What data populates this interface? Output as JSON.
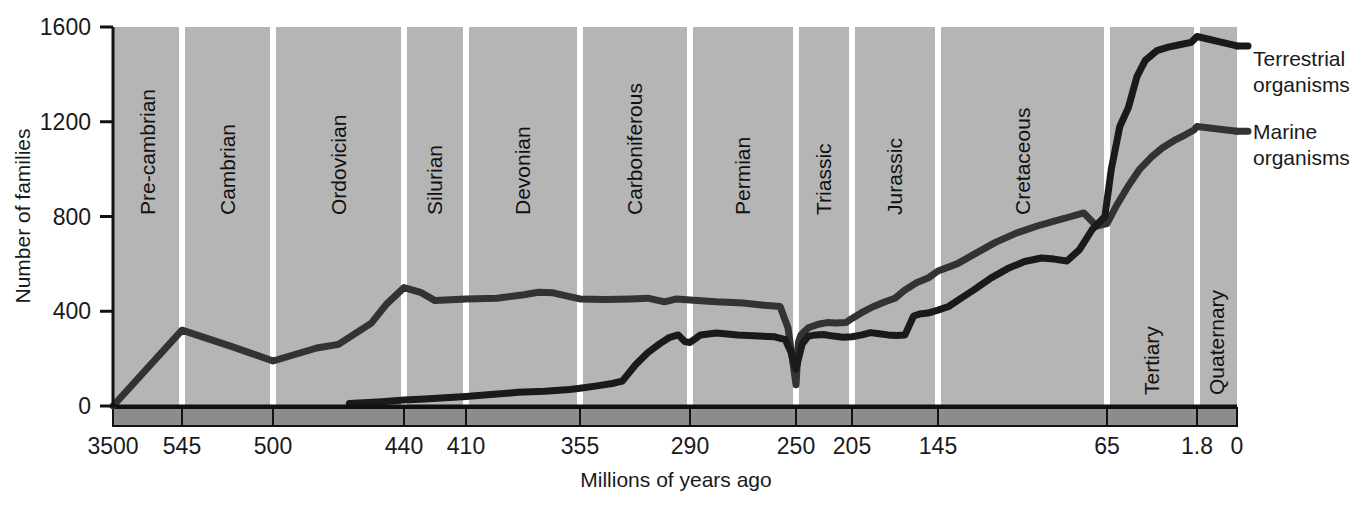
{
  "chart_data": {
    "type": "line",
    "title": "",
    "xlabel": "Millions of years ago",
    "ylabel": "Number of families",
    "xlim": [
      3500,
      0
    ],
    "ylim": [
      0,
      1600
    ],
    "x_ticks": [
      "3500",
      "545",
      "500",
      "440",
      "410",
      "355",
      "290",
      "250",
      "205",
      "145",
      "65",
      "1.8",
      "0"
    ],
    "y_ticks": [
      "0",
      "400",
      "800",
      "1200",
      "1600"
    ],
    "grid": false,
    "legend_position": "right",
    "periods": [
      {
        "name": "Pre-cambrian",
        "start": 3500,
        "end": 545
      },
      {
        "name": "Cambrian",
        "start": 545,
        "end": 500
      },
      {
        "name": "Ordovician",
        "start": 500,
        "end": 440
      },
      {
        "name": "Silurian",
        "start": 440,
        "end": 410
      },
      {
        "name": "Devonian",
        "start": 410,
        "end": 355
      },
      {
        "name": "Carboniferous",
        "start": 355,
        "end": 290
      },
      {
        "name": "Permian",
        "start": 290,
        "end": 250
      },
      {
        "name": "Triassic",
        "start": 250,
        "end": 205
      },
      {
        "name": "Jurassic",
        "start": 205,
        "end": 145
      },
      {
        "name": "Cretaceous",
        "start": 145,
        "end": 65
      },
      {
        "name": "Tertiary",
        "start": 65,
        "end": 1.8
      },
      {
        "name": "Quaternary",
        "start": 1.8,
        "end": 0
      }
    ],
    "series": [
      {
        "name": "Marine organisms",
        "color": "#333333",
        "points": [
          [
            3500,
            0
          ],
          [
            545,
            320
          ],
          [
            520,
            250
          ],
          [
            500,
            190
          ],
          [
            480,
            245
          ],
          [
            470,
            260
          ],
          [
            455,
            350
          ],
          [
            448,
            430
          ],
          [
            440,
            500
          ],
          [
            432,
            480
          ],
          [
            425,
            445
          ],
          [
            415,
            450
          ],
          [
            410,
            452
          ],
          [
            395,
            455
          ],
          [
            382,
            470
          ],
          [
            375,
            480
          ],
          [
            368,
            478
          ],
          [
            360,
            462
          ],
          [
            355,
            452
          ],
          [
            340,
            450
          ],
          [
            325,
            452
          ],
          [
            315,
            455
          ],
          [
            305,
            440
          ],
          [
            298,
            452
          ],
          [
            290,
            448
          ],
          [
            280,
            440
          ],
          [
            270,
            435
          ],
          [
            262,
            425
          ],
          [
            256,
            420
          ],
          [
            253,
            330
          ],
          [
            250,
            90
          ],
          [
            248,
            270
          ],
          [
            246,
            300
          ],
          [
            240,
            330
          ],
          [
            232,
            345
          ],
          [
            225,
            352
          ],
          [
            218,
            350
          ],
          [
            210,
            352
          ],
          [
            205,
            370
          ],
          [
            198,
            395
          ],
          [
            190,
            420
          ],
          [
            182,
            440
          ],
          [
            175,
            455
          ],
          [
            168,
            490
          ],
          [
            160,
            520
          ],
          [
            152,
            540
          ],
          [
            145,
            570
          ],
          [
            136,
            600
          ],
          [
            128,
            640
          ],
          [
            118,
            690
          ],
          [
            108,
            730
          ],
          [
            98,
            760
          ],
          [
            90,
            780
          ],
          [
            82,
            800
          ],
          [
            76,
            815
          ],
          [
            70,
            760
          ],
          [
            65,
            770
          ],
          [
            58,
            850
          ],
          [
            50,
            930
          ],
          [
            42,
            1000
          ],
          [
            34,
            1050
          ],
          [
            26,
            1090
          ],
          [
            18,
            1120
          ],
          [
            10,
            1145
          ],
          [
            4,
            1165
          ],
          [
            1.8,
            1180
          ],
          [
            0,
            1160
          ]
        ]
      },
      {
        "name": "Terrestrial organisms",
        "color": "#1a1a1a",
        "points": [
          [
            465,
            10
          ],
          [
            450,
            18
          ],
          [
            440,
            25
          ],
          [
            430,
            30
          ],
          [
            420,
            35
          ],
          [
            410,
            40
          ],
          [
            398,
            48
          ],
          [
            385,
            58
          ],
          [
            372,
            62
          ],
          [
            360,
            70
          ],
          [
            355,
            75
          ],
          [
            345,
            85
          ],
          [
            336,
            95
          ],
          [
            330,
            105
          ],
          [
            322,
            175
          ],
          [
            315,
            225
          ],
          [
            308,
            262
          ],
          [
            302,
            290
          ],
          [
            297,
            300
          ],
          [
            293,
            272
          ],
          [
            290,
            268
          ],
          [
            286,
            300
          ],
          [
            280,
            308
          ],
          [
            272,
            300
          ],
          [
            264,
            295
          ],
          [
            258,
            292
          ],
          [
            254,
            280
          ],
          [
            252,
            230
          ],
          [
            250,
            155
          ],
          [
            248,
            200
          ],
          [
            245,
            262
          ],
          [
            240,
            295
          ],
          [
            234,
            300
          ],
          [
            228,
            302
          ],
          [
            220,
            295
          ],
          [
            212,
            290
          ],
          [
            205,
            292
          ],
          [
            198,
            300
          ],
          [
            192,
            310
          ],
          [
            186,
            305
          ],
          [
            180,
            300
          ],
          [
            174,
            298
          ],
          [
            168,
            300
          ],
          [
            162,
            380
          ],
          [
            158,
            388
          ],
          [
            152,
            392
          ],
          [
            148,
            400
          ],
          [
            145,
            405
          ],
          [
            140,
            420
          ],
          [
            134,
            455
          ],
          [
            128,
            490
          ],
          [
            120,
            540
          ],
          [
            112,
            580
          ],
          [
            104,
            610
          ],
          [
            96,
            625
          ],
          [
            90,
            620
          ],
          [
            84,
            612
          ],
          [
            78,
            660
          ],
          [
            72,
            745
          ],
          [
            66,
            800
          ],
          [
            62,
            1000
          ],
          [
            56,
            1180
          ],
          [
            50,
            1260
          ],
          [
            44,
            1390
          ],
          [
            38,
            1460
          ],
          [
            30,
            1500
          ],
          [
            22,
            1515
          ],
          [
            14,
            1525
          ],
          [
            6,
            1535
          ],
          [
            1.8,
            1560
          ],
          [
            0,
            1520
          ]
        ]
      }
    ]
  },
  "legend": {
    "terrestrial_line1": "Terrestrial",
    "terrestrial_line2": "organisms",
    "marine_line1": "Marine",
    "marine_line2": "organisms"
  },
  "colors": {
    "plot_background": "#b5b5b5",
    "band_background": "#8c8c8c",
    "gridline": "#ffffff",
    "axis": "#111111"
  }
}
